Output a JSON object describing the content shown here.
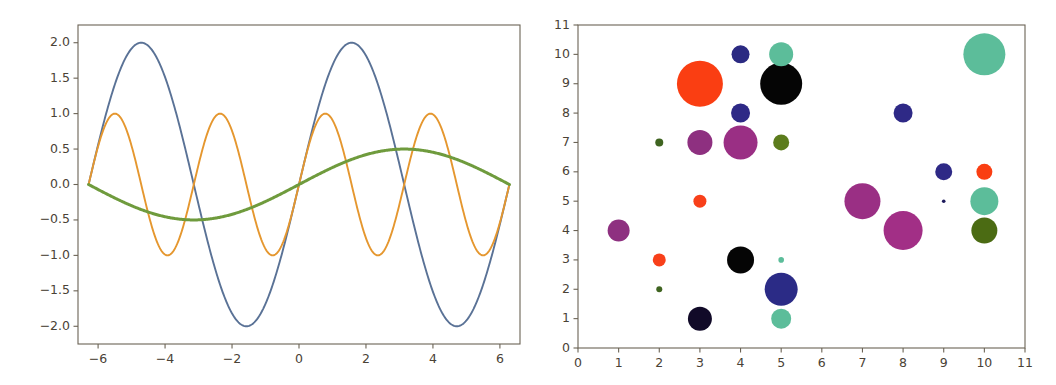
{
  "figure": {
    "background_color": "#ffffff",
    "width": 1056,
    "height": 385,
    "panel_count": 2
  },
  "chart_data": [
    {
      "type": "line",
      "title": "",
      "xlabel": "",
      "ylabel": "",
      "xlim": [
        -6.6,
        6.6
      ],
      "ylim": [
        -2.25,
        2.25
      ],
      "grid": false,
      "legend": null,
      "xticks": [
        -6,
        -4,
        -2,
        0,
        2,
        4,
        6
      ],
      "xticklabels": [
        "−6",
        "−4",
        "−2",
        "0",
        "2",
        "4",
        "6"
      ],
      "yticks": [
        -2.0,
        -1.5,
        -1.0,
        -0.5,
        0.0,
        0.5,
        1.0,
        1.5,
        2.0
      ],
      "yticklabels": [
        "−2.0",
        "−1.5",
        "−1.0",
        "−0.5",
        "0.0",
        "0.5",
        "1.0",
        "1.5",
        "2.0"
      ],
      "series": [
        {
          "name": "2*sin(x)",
          "color": "#5a7296",
          "linewidth": 1.9,
          "amplitude": 2.0,
          "frequency": 1.0,
          "phase": 0.0,
          "function": "2*sin(x)"
        },
        {
          "name": "sin(2x)",
          "color": "#e5972f",
          "linewidth": 1.9,
          "amplitude": 1.0,
          "frequency": 2.0,
          "phase": 0.0,
          "function": "sin(2x)"
        },
        {
          "name": "0.5*sin(0.5x)",
          "color": "#6f9b3d",
          "linewidth": 3.0,
          "amplitude": 0.5,
          "frequency": 0.5,
          "phase": 0.0,
          "function": "0.5*sin(0.5x)"
        }
      ]
    },
    {
      "type": "scatter",
      "title": "",
      "xlabel": "",
      "ylabel": "",
      "xlim": [
        0,
        11
      ],
      "ylim": [
        0,
        11
      ],
      "grid": false,
      "legend": null,
      "xticks": [
        0,
        1,
        2,
        3,
        4,
        5,
        6,
        7,
        8,
        9,
        10,
        11
      ],
      "xticklabels": [
        "0",
        "1",
        "2",
        "3",
        "4",
        "5",
        "6",
        "7",
        "8",
        "9",
        "10",
        "11"
      ],
      "yticks": [
        0,
        1,
        2,
        3,
        4,
        5,
        6,
        7,
        8,
        9,
        10,
        11
      ],
      "yticklabels": [
        "0",
        "1",
        "2",
        "3",
        "4",
        "5",
        "6",
        "7",
        "8",
        "9",
        "10",
        "11"
      ],
      "points": [
        {
          "x": 1,
          "y": 4,
          "size": 11,
          "color": "#8e3080"
        },
        {
          "x": 2,
          "y": 2,
          "size": 3.0,
          "color": "#3f6420"
        },
        {
          "x": 2,
          "y": 3,
          "size": 6.5,
          "color": "#f8401a"
        },
        {
          "x": 2,
          "y": 7,
          "size": 4.0,
          "color": "#3f6420"
        },
        {
          "x": 3,
          "y": 1,
          "size": 12,
          "color": "#110a28"
        },
        {
          "x": 3,
          "y": 5,
          "size": 6.5,
          "color": "#f8401a"
        },
        {
          "x": 3,
          "y": 7,
          "size": 12.5,
          "color": "#8e3080"
        },
        {
          "x": 3,
          "y": 9,
          "size": 23,
          "color": "#fa3e12"
        },
        {
          "x": 4,
          "y": 3,
          "size": 13.5,
          "color": "#050505"
        },
        {
          "x": 4,
          "y": 7,
          "size": 17,
          "color": "#9a2f84"
        },
        {
          "x": 4,
          "y": 8,
          "size": 9.5,
          "color": "#2e2986"
        },
        {
          "x": 4,
          "y": 10,
          "size": 9.0,
          "color": "#2b2a82"
        },
        {
          "x": 5,
          "y": 1,
          "size": 10,
          "color": "#5cbd9a"
        },
        {
          "x": 5,
          "y": 2,
          "size": 16.5,
          "color": "#2b2b86"
        },
        {
          "x": 5,
          "y": 3,
          "size": 2.8,
          "color": "#5cbd9a"
        },
        {
          "x": 5,
          "y": 7,
          "size": 8.0,
          "color": "#5c7c1c"
        },
        {
          "x": 5,
          "y": 9,
          "size": 21,
          "color": "#050505"
        },
        {
          "x": 5,
          "y": 10,
          "size": 12,
          "color": "#5cbd9a"
        },
        {
          "x": 7,
          "y": 5,
          "size": 18,
          "color": "#9a2f84"
        },
        {
          "x": 8,
          "y": 4,
          "size": 19.5,
          "color": "#a22f86"
        },
        {
          "x": 8,
          "y": 8,
          "size": 9.5,
          "color": "#2e2986"
        },
        {
          "x": 9,
          "y": 5,
          "size": 1.8,
          "color": "#1e1b5c"
        },
        {
          "x": 9,
          "y": 6,
          "size": 8.5,
          "color": "#2e2986"
        },
        {
          "x": 10,
          "y": 4,
          "size": 13,
          "color": "#4b6b13"
        },
        {
          "x": 10,
          "y": 5,
          "size": 14,
          "color": "#5cbd9a"
        },
        {
          "x": 10,
          "y": 6,
          "size": 8.0,
          "color": "#fa3e12"
        },
        {
          "x": 10,
          "y": 10,
          "size": 21,
          "color": "#5cbd9a"
        }
      ]
    }
  ]
}
